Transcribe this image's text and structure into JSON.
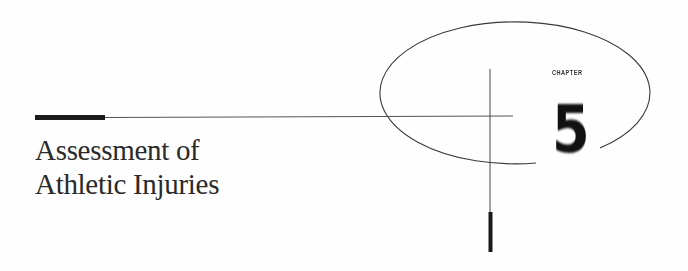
{
  "chapter": {
    "label": "CHAPTER",
    "number": "5"
  },
  "title": {
    "line1": "Assessment of",
    "line2": "Athletic Injuries"
  },
  "colors": {
    "ink": "#1a1a1a",
    "rule": "#444444",
    "background": "#ffffff"
  }
}
